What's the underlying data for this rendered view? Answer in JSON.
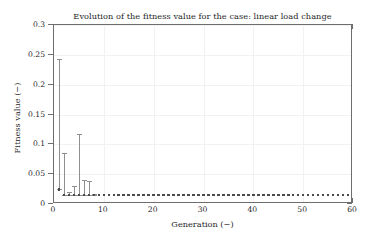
{
  "chart_data": {
    "type": "scatter",
    "title": "Evolution of the fitness value for the case: linear load change",
    "xlabel": "Generation (−)",
    "ylabel": "Fitness value (−)",
    "xlim": [
      0,
      60
    ],
    "ylim": [
      0,
      0.3
    ],
    "xticks": [
      0,
      10,
      20,
      30,
      40,
      50,
      60
    ],
    "xtick_labels": [
      "0",
      "10",
      "20",
      "30",
      "40",
      "50",
      "60"
    ],
    "yticks": [
      0,
      0.05,
      0.1,
      0.15,
      0.2,
      0.25,
      0.3
    ],
    "ytick_labels": [
      "0",
      "0.05",
      "0.1",
      "0.15",
      "0.2",
      "0.25",
      "0.3"
    ],
    "grid": true,
    "legend": null,
    "marker_color": "#4a4a4a",
    "errorbar_color": "#8f8f8f",
    "series": [
      {
        "name": "best fitness (mean with spread)",
        "x": [
          1,
          2,
          3,
          4,
          5,
          6,
          7,
          8,
          9,
          10,
          11,
          12,
          13,
          14,
          15,
          16,
          17,
          18,
          19,
          20,
          21,
          22,
          23,
          24,
          25,
          26,
          27,
          28,
          29,
          30,
          31,
          32,
          33,
          34,
          35,
          36,
          37,
          38,
          39,
          40,
          41,
          42,
          43,
          44,
          45,
          46,
          47,
          48,
          49,
          50,
          51,
          52,
          53,
          54,
          55,
          56,
          57,
          58,
          59,
          60
        ],
        "values": [
          0.0247,
          0.0152,
          0.0152,
          0.0152,
          0.0152,
          0.0152,
          0.0152,
          0.0152,
          0.0152,
          0.0152,
          0.0152,
          0.0152,
          0.0152,
          0.0152,
          0.0152,
          0.0152,
          0.0152,
          0.0152,
          0.0152,
          0.0152,
          0.0152,
          0.0152,
          0.0152,
          0.0152,
          0.0152,
          0.0152,
          0.0152,
          0.0152,
          0.0152,
          0.0152,
          0.0152,
          0.0152,
          0.0152,
          0.0152,
          0.0152,
          0.0152,
          0.0152,
          0.0152,
          0.0152,
          0.0152,
          0.0152,
          0.0152,
          0.0152,
          0.0152,
          0.0152,
          0.0152,
          0.0152,
          0.0152,
          0.0152,
          0.0152,
          0.0152,
          0.0152,
          0.0152,
          0.0152,
          0.0152,
          0.0152,
          0.0152,
          0.0152,
          0.0152,
          0.0152
        ],
        "err_upper": [
          0.243,
          0.086,
          0.0195,
          0.03,
          0.1165,
          0.041,
          0.0385,
          0.0175,
          0.0152,
          0.0152,
          0.0152,
          0.0152,
          0.0152,
          0.0152,
          0.0152,
          0.0152,
          0.0152,
          0.0152,
          0.0152,
          0.0152,
          0.0152,
          0.0152,
          0.0152,
          0.0152,
          0.0152,
          0.0152,
          0.0152,
          0.0152,
          0.0152,
          0.0152,
          0.0152,
          0.0152,
          0.0152,
          0.0152,
          0.0152,
          0.0152,
          0.0152,
          0.0152,
          0.0152,
          0.0152,
          0.0152,
          0.0152,
          0.0152,
          0.0152,
          0.0152,
          0.0152,
          0.0152,
          0.0152,
          0.0152,
          0.0152,
          0.0152,
          0.0152,
          0.0152,
          0.0152,
          0.0152,
          0.0152,
          0.0152,
          0.0152,
          0.0152,
          0.0152
        ],
        "err_lower": [
          0.0247,
          0.0152,
          0.0152,
          0.0152,
          0.0152,
          0.0152,
          0.0152,
          0.0152,
          0.0152,
          0.0152,
          0.0152,
          0.0152,
          0.0152,
          0.0152,
          0.0152,
          0.0152,
          0.0152,
          0.0152,
          0.0152,
          0.0152,
          0.0152,
          0.0152,
          0.0152,
          0.0152,
          0.0152,
          0.0152,
          0.0152,
          0.0152,
          0.0152,
          0.0152,
          0.0152,
          0.0152,
          0.0152,
          0.0152,
          0.0152,
          0.0152,
          0.0152,
          0.0152,
          0.0152,
          0.0152,
          0.0152,
          0.0152,
          0.0152,
          0.0152,
          0.0152,
          0.0152,
          0.0152,
          0.0152,
          0.0152,
          0.0152,
          0.0152,
          0.0152,
          0.0152,
          0.0152,
          0.0152,
          0.0152,
          0.0152,
          0.0152,
          0.0152,
          0.0152
        ]
      }
    ]
  }
}
